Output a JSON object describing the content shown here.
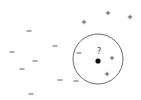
{
  "diagram": {
    "query": {
      "label": "?",
      "x": 98,
      "y": 61,
      "label_x": 99,
      "label_y": 51
    },
    "neighborhood_circle": {
      "cx": 98,
      "cy": 59,
      "r": 25,
      "stroke": "#444444"
    },
    "negative_points": [
      {
        "symbol": "−",
        "x": 29,
        "y": 31
      },
      {
        "symbol": "−",
        "x": 12,
        "y": 52
      },
      {
        "symbol": "−",
        "x": 35,
        "y": 61
      },
      {
        "symbol": "−",
        "x": 22,
        "y": 69
      },
      {
        "symbol": "−",
        "x": 55,
        "y": 46
      },
      {
        "symbol": "−",
        "x": 79,
        "y": 53
      },
      {
        "symbol": "−",
        "x": 60,
        "y": 80
      },
      {
        "symbol": "−",
        "x": 76,
        "y": 81
      },
      {
        "symbol": "−",
        "x": 31,
        "y": 94
      }
    ],
    "positive_points": [
      {
        "symbol": "+",
        "x": 108,
        "y": 13
      },
      {
        "symbol": "+",
        "x": 84,
        "y": 22
      },
      {
        "symbol": "+",
        "x": 130,
        "y": 17
      },
      {
        "symbol": "+",
        "x": 112,
        "y": 58
      },
      {
        "symbol": "+",
        "x": 107,
        "y": 74
      }
    ],
    "colors": {
      "symbol": "#333333",
      "query_dot": "#111111",
      "background": "#ffffff"
    }
  }
}
